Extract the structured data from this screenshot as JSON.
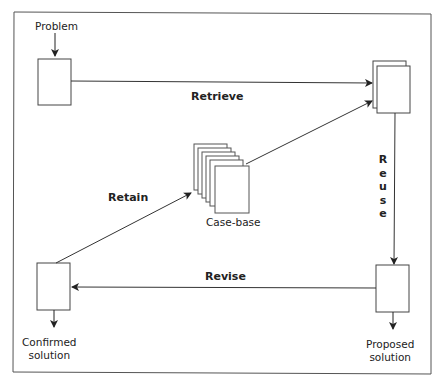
{
  "diagram": {
    "nodes": {
      "problem": {
        "label": "Problem"
      },
      "retrieved_case": {
        "label": ""
      },
      "case_base": {
        "label": "Case-base"
      },
      "proposed_solution": {
        "label_line1": "Proposed",
        "label_line2": "solution"
      },
      "confirmed_solution": {
        "label_line1": "Confirmed",
        "label_line2": "solution"
      }
    },
    "edges": {
      "retrieve": {
        "label": "Retrieve",
        "from": "problem",
        "to": "retrieved_case"
      },
      "reuse": {
        "label": "Reuse",
        "letters": [
          "R",
          "e",
          "u",
          "s",
          "e"
        ],
        "from": "retrieved_case",
        "to": "proposed_solution"
      },
      "revise": {
        "label": "Revise",
        "from": "proposed_solution",
        "to": "confirmed_solution"
      },
      "retain": {
        "label": "Retain",
        "from": "confirmed_solution",
        "to": "case_base"
      },
      "case_base_link": {
        "label": "",
        "from": "case_base",
        "to": "retrieved_case"
      }
    },
    "colors": {
      "stroke": "#333333",
      "background": "#ffffff",
      "text": "#222222"
    }
  }
}
